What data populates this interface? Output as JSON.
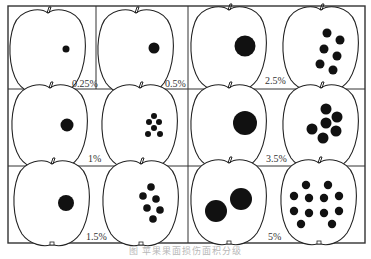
{
  "figure": {
    "caption": "图 苹果果面损伤面积分级",
    "grid": {
      "rows": 3,
      "cols": 2
    },
    "cells": [
      {
        "label": "0.25%",
        "left": {
          "spots": [
            [
              60,
              50,
              4
            ]
          ]
        },
        "right": null,
        "type": "single-only-pair",
        "right_single": {
          "spots": [
            [
              156,
              47,
              6
            ]
          ]
        },
        "right_label": "0.5%"
      },
      {
        "label": "2.5%"
      },
      {
        "label": "1%"
      },
      {
        "label": "3.5%"
      },
      {
        "label": "1.5%"
      },
      {
        "label": "5%"
      }
    ],
    "labels": {
      "l025": "0.25%",
      "l05": "0.5%",
      "l25": "2.5%",
      "l1": "1%",
      "l35": "3.5%",
      "l15": "1.5%",
      "l5": "5%"
    }
  }
}
